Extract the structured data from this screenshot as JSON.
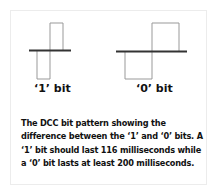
{
  "diagram": {
    "bit1": {
      "label": "‘1’ bit"
    },
    "bit0": {
      "label": "‘0’ bit"
    },
    "line_color": "#999999",
    "axis_color": "#333333"
  },
  "caption": "The DCC bit pattern showing the difference between the ‘1’ and ‘0’ bits. A ‘1’ bit should last 116 milliseconds while a ‘0’ bit lasts at least 200 milliseconds."
}
